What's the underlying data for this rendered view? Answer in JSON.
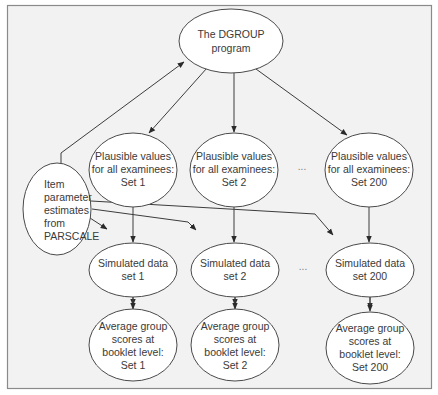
{
  "diagram": {
    "title": "",
    "nodes": {
      "dgroup": {
        "lines": [
          "The DGROUP",
          "program"
        ]
      },
      "parscale": {
        "lines": [
          "Item",
          "parameter",
          "estimates",
          "from",
          "PARSCALE"
        ]
      },
      "pv1": {
        "lines": [
          "Plausible values",
          "for all examinees:",
          "Set 1"
        ]
      },
      "pv2": {
        "lines": [
          "Plausible values",
          "for all examinees:",
          "Set 2"
        ]
      },
      "pv200": {
        "lines": [
          "Plausible values",
          "for all examinees:",
          "Set 200"
        ]
      },
      "sim1": {
        "lines": [
          "Simulated data",
          "set 1"
        ]
      },
      "sim2": {
        "lines": [
          "Simulated data",
          "set 2"
        ]
      },
      "sim200": {
        "lines": [
          "Simulated data",
          "set 200"
        ]
      },
      "avg1": {
        "lines": [
          "Average group",
          "scores at",
          "booklet level:",
          "Set 1"
        ]
      },
      "avg2": {
        "lines": [
          "Average group",
          "scores at",
          "booklet level:",
          "Set 2"
        ]
      },
      "avg200": {
        "lines": [
          "Average group",
          "scores at",
          "booklet level:",
          "Set 200"
        ]
      }
    },
    "ellipsis": "...",
    "edges": [
      {
        "from": "parscale",
        "to": "dgroup"
      },
      {
        "from": "dgroup",
        "to": "pv1"
      },
      {
        "from": "dgroup",
        "to": "pv2"
      },
      {
        "from": "dgroup",
        "to": "pv200"
      },
      {
        "from": "pv1",
        "to": "sim1"
      },
      {
        "from": "pv2",
        "to": "sim2"
      },
      {
        "from": "pv200",
        "to": "sim200"
      },
      {
        "from": "parscale",
        "to": "sim1"
      },
      {
        "from": "parscale",
        "to": "sim2"
      },
      {
        "from": "parscale",
        "to": "sim200"
      },
      {
        "from": "sim1",
        "to": "avg1"
      },
      {
        "from": "sim2",
        "to": "avg2"
      },
      {
        "from": "sim200",
        "to": "avg200"
      }
    ],
    "colors": {
      "background": "#f2f2f2",
      "node_fill": "#ffffff",
      "stroke": "#3c3c3c",
      "text": "#3a3a3a"
    }
  }
}
